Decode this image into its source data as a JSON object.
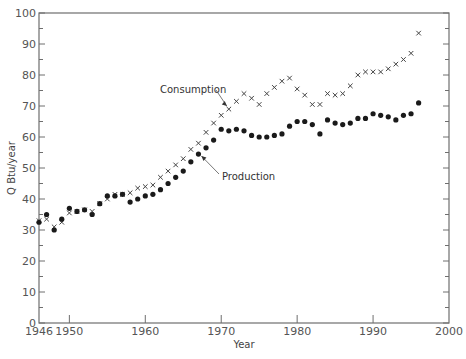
{
  "chart_data": {
    "type": "scatter",
    "title": "",
    "xlabel": "Year",
    "ylabel": "Q Btu/year",
    "xlim": [
      1946,
      2000
    ],
    "ylim": [
      0,
      100
    ],
    "x_ticks": [
      1946,
      1950,
      1960,
      1970,
      1980,
      1990,
      2000
    ],
    "y_ticks": [
      0,
      10,
      20,
      30,
      40,
      50,
      60,
      70,
      80,
      90,
      100
    ],
    "grid": false,
    "legend": "none (inline annotations with arrows)",
    "annotations": [
      {
        "text": "Consumption",
        "points_to": [
          1971,
          69
        ]
      },
      {
        "text": "Production",
        "points_to": [
          1967,
          54.5
        ]
      }
    ],
    "x": [
      1946,
      1947,
      1948,
      1949,
      1950,
      1951,
      1952,
      1953,
      1954,
      1955,
      1956,
      1957,
      1958,
      1959,
      1960,
      1961,
      1962,
      1963,
      1964,
      1965,
      1966,
      1967,
      1968,
      1969,
      1970,
      1971,
      1972,
      1973,
      1974,
      1975,
      1976,
      1977,
      1978,
      1979,
      1980,
      1981,
      1982,
      1983,
      1984,
      1985,
      1986,
      1987,
      1988,
      1989,
      1990,
      1991,
      1992,
      1993,
      1994,
      1995,
      1996
    ],
    "series": [
      {
        "name": "Consumption",
        "marker": "x",
        "values": [
          33,
          33.5,
          31,
          32.5,
          35.5,
          36,
          36.5,
          36,
          38.5,
          40,
          41.5,
          41.5,
          42,
          43.5,
          44,
          44.5,
          47,
          49,
          51,
          53,
          56,
          58,
          61.5,
          64.5,
          67,
          69,
          71.5,
          74,
          72.5,
          70.5,
          74,
          76,
          78,
          79,
          75.5,
          73.5,
          70.5,
          70.5,
          74,
          73.5,
          74,
          76.5,
          80,
          81,
          81,
          81,
          82,
          83.5,
          85,
          87,
          93.5
        ]
      },
      {
        "name": "Production",
        "marker": "filled-circle",
        "values": [
          32.5,
          35,
          30,
          33.5,
          37,
          36,
          36.5,
          35,
          38.5,
          41,
          41,
          41.5,
          39,
          40,
          41,
          41.5,
          43,
          45,
          47,
          49,
          52,
          54.5,
          56.5,
          59,
          62.5,
          62,
          62.5,
          62,
          60.5,
          60,
          60,
          60.5,
          61,
          63.5,
          65,
          65,
          64,
          61,
          65.5,
          64.5,
          64,
          64.5,
          66,
          66,
          67.5,
          67,
          66.5,
          65.5,
          67,
          67.5,
          71
        ]
      }
    ]
  },
  "colors": {
    "axis": "#6e6e6e",
    "marker": "#1a1a1a",
    "text": "#555555"
  }
}
